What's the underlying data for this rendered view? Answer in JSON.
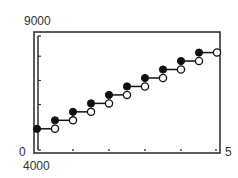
{
  "chart_data": {
    "type": "line",
    "subtype": "step-function",
    "title": "",
    "xlabel": "",
    "ylabel": "",
    "xlim": [
      0,
      5
    ],
    "ylim": [
      4000,
      9000
    ],
    "x_tick_labels": {
      "min": "0",
      "max": "5"
    },
    "y_tick_labels": {
      "min": "4000",
      "max": "9000"
    },
    "x_ticks": [
      0.5,
      1.5,
      2.5,
      3.5,
      4.5
    ],
    "y_ticks": [
      5000,
      6000,
      7000,
      8000
    ],
    "grid": false,
    "legend": null,
    "steps": [
      {
        "x_start": 0.0,
        "x_end": 0.5,
        "y": 5000
      },
      {
        "x_start": 0.5,
        "x_end": 1.0,
        "y": 5350
      },
      {
        "x_start": 1.0,
        "x_end": 1.5,
        "y": 5700
      },
      {
        "x_start": 1.5,
        "x_end": 2.0,
        "y": 6050
      },
      {
        "x_start": 2.0,
        "x_end": 2.5,
        "y": 6400
      },
      {
        "x_start": 2.5,
        "x_end": 3.0,
        "y": 6750
      },
      {
        "x_start": 3.0,
        "x_end": 3.5,
        "y": 7100
      },
      {
        "x_start": 3.5,
        "x_end": 4.0,
        "y": 7450
      },
      {
        "x_start": 4.0,
        "x_end": 4.5,
        "y": 7800
      },
      {
        "x_start": 4.5,
        "x_end": 5.0,
        "y": 8150
      }
    ],
    "markers": {
      "left_endpoint": "filled-circle",
      "right_endpoint": "open-circle"
    }
  },
  "labels": {
    "y_max": "9000",
    "y_min_axis": "0",
    "x_min": "4000",
    "x_max": "5"
  }
}
